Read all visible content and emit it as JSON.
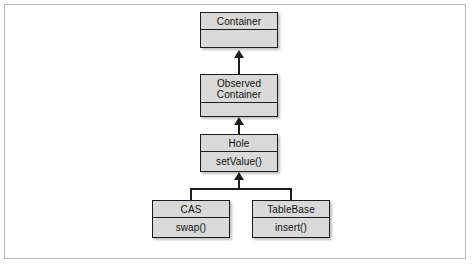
{
  "diagram": {
    "type": "uml-class-diagram",
    "title": "",
    "background_color": "#ffffff",
    "frame_color": "#b9b9b9",
    "box_fill_color": "#d9d9d9",
    "box_border_color": "#1d1d1d",
    "relationship": "generalization",
    "classes": [
      {
        "id": "container",
        "name": "Container",
        "operations": "",
        "level": 0
      },
      {
        "id": "observed-container",
        "name": "Observed\nContainer",
        "operations": "",
        "level": 1
      },
      {
        "id": "hole",
        "name": "Hole",
        "operations": "setValue()",
        "level": 2
      },
      {
        "id": "cas",
        "name": "CAS",
        "operations": "swap()",
        "level": 3
      },
      {
        "id": "tablebase",
        "name": "TableBase",
        "operations": "insert()",
        "level": 3
      }
    ],
    "edges": [
      {
        "from": "observed-container",
        "to": "container"
      },
      {
        "from": "hole",
        "to": "observed-container"
      },
      {
        "from": "cas",
        "to": "hole"
      },
      {
        "from": "tablebase",
        "to": "hole"
      }
    ]
  }
}
